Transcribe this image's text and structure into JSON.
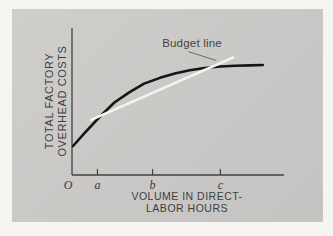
{
  "figure": {
    "panel_bg": "#c9c8c6",
    "page_bg": "#f6f5f2",
    "y_axis_label_line1": "TOTAL FACTORY",
    "y_axis_label_line2": "OVERHEAD COSTS",
    "x_axis_label_line1": "VOLUME IN DIRECT-",
    "x_axis_label_line2": "LABOR HOURS"
  },
  "chart_data": {
    "type": "line",
    "title": "",
    "xlabel": "VOLUME IN DIRECT-LABOR HOURS",
    "ylabel": "TOTAL FACTORY OVERHEAD COSTS",
    "xlim": [
      0,
      100
    ],
    "ylim": [
      0,
      100
    ],
    "grid": false,
    "legend": "none",
    "axis_color": "#424140",
    "tick_label_color": "#3a3938",
    "xticks": [
      {
        "label": "O",
        "x": 0,
        "mark": false,
        "dx": -4
      },
      {
        "label": "a",
        "x": 12,
        "mark": true,
        "dx": 0
      },
      {
        "label": "b",
        "x": 38,
        "mark": true,
        "dx": 0
      },
      {
        "label": "c",
        "x": 70,
        "mark": true,
        "dx": 0
      }
    ],
    "series": [
      {
        "name": "total-overhead-cost-curve",
        "color": "#151515",
        "width": 2.6,
        "points": [
          [
            0.5,
            20
          ],
          [
            6,
            29
          ],
          [
            13,
            40
          ],
          [
            20,
            50
          ],
          [
            27,
            57
          ],
          [
            34,
            63
          ],
          [
            41.5,
            67
          ],
          [
            48.5,
            70
          ],
          [
            55.5,
            72.3
          ],
          [
            62.5,
            73.8
          ],
          [
            70,
            74.8
          ],
          [
            77,
            75.3
          ],
          [
            84,
            75.6
          ],
          [
            90,
            75.9
          ]
        ]
      },
      {
        "name": "budget-line",
        "color": "#f4f3ef",
        "width": 2.6,
        "points": [
          [
            9,
            38
          ],
          [
            76,
            81
          ]
        ]
      }
    ],
    "annotations": [
      {
        "text": "Budget line",
        "target_series": "budget-line",
        "leader_from": [
          55,
          85
        ],
        "leader_to": [
          68,
          79
        ],
        "leader_color": "#6b6a66"
      }
    ]
  }
}
